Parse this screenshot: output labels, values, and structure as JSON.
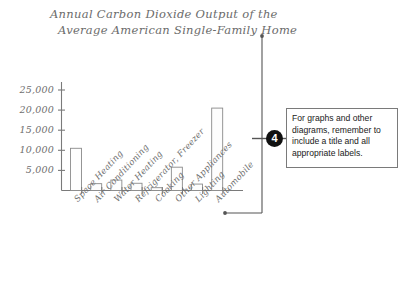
{
  "chart_data": {
    "type": "bar",
    "title": "Annual Carbon Dioxide Output of the Average American Single-Family Home",
    "title_lines": [
      "Annual Carbon Dioxide Output of the",
      "Average American Single-Family Home"
    ],
    "xlabel": "",
    "ylabel": "",
    "categories": [
      "Space Heating",
      "Air Conditioning",
      "Water Heating",
      "Refrigerator, Freezer",
      "Cooking",
      "Other Appliances",
      "Lighting",
      "Automobile"
    ],
    "values": [
      10500,
      1700,
      2600,
      1800,
      700,
      5800,
      1600,
      20500
    ],
    "ylim": [
      0,
      27000
    ],
    "yticks": [
      5000,
      10000,
      15000,
      20000,
      25000
    ],
    "ytick_labels": [
      "5,000",
      "10,000",
      "15,000",
      "20,000",
      "25,000"
    ],
    "grid": false,
    "legend": false,
    "bar_fill": "#fdfdfd",
    "bar_stroke": "#8a8a8a",
    "axis_color": "#7a7a7a"
  },
  "callout": {
    "marker": "4",
    "text": "For graphs and other diagrams, remember to include a title and all appropriate labels."
  },
  "annotation": {
    "leader_color": "#555555"
  }
}
